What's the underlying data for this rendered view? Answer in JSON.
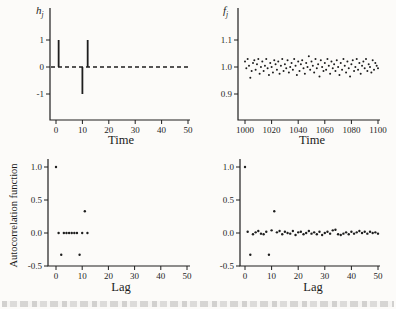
{
  "figure": {
    "background": "#fcfbf9",
    "ink": "#1e1e1e"
  },
  "chart_data": [
    {
      "id": "impulse-response",
      "type": "stem",
      "ylabel_parts": {
        "base": "h",
        "sub": "j"
      },
      "xlabel": "Time",
      "xlim": [
        0,
        50
      ],
      "ylim": [
        -2,
        2.2
      ],
      "xticks": [
        "0",
        "10",
        "20",
        "30",
        "40",
        "50"
      ],
      "yticks": [
        "1",
        "0",
        "-1"
      ],
      "zero_line": "dashed",
      "grid": "off",
      "points": [
        {
          "x": 1,
          "y": 1
        },
        {
          "x": 10,
          "y": -1
        },
        {
          "x": 12,
          "y": 1
        }
      ]
    },
    {
      "id": "time-series",
      "type": "scatter",
      "ylabel_parts": {
        "base": "f",
        "sub": "j"
      },
      "xlabel": "Time",
      "xlim": [
        1000,
        1100
      ],
      "ylim": [
        0.8,
        1.22
      ],
      "xticks": [
        "1000",
        "1020",
        "1040",
        "1060",
        "1080",
        "1100"
      ],
      "yticks": [
        "1.1",
        "1.0",
        "0.9"
      ],
      "grid": "off",
      "x_start": 1000,
      "x_step": 1,
      "values": [
        1.02,
        0.995,
        1.03,
        1.005,
        0.96,
        0.985,
        1.015,
        1.025,
        0.99,
        1.01,
        1.03,
        0.975,
        1.0,
        1.02,
        0.985,
        1.005,
        1.03,
        0.995,
        0.97,
        1.015,
        1.0,
        0.98,
        1.025,
        1.01,
        0.99,
        1.02,
        0.975,
        1.005,
        1.03,
        0.985,
        1.01,
        0.995,
        1.025,
        0.98,
        1.0,
        1.015,
        0.99,
        1.03,
        1.005,
        0.97,
        1.02,
        0.985,
        1.01,
        1.025,
        0.995,
        0.975,
        1.015,
        1.0,
        1.04,
        0.99,
        1.02,
        1.005,
        0.98,
        1.03,
        0.995,
        1.01,
        0.965,
        1.025,
        1.0,
        0.985,
        1.015,
        0.99,
        1.03,
        1.005,
        0.975,
        1.02,
        0.995,
        1.01,
        0.985,
        1.025,
        1.0,
        0.97,
        1.015,
        0.99,
        1.03,
        1.005,
        0.98,
        1.02,
        0.995,
        0.965,
        1.01,
        1.025,
        0.985,
        1.0,
        1.03,
        0.99,
        1.015,
        0.975,
        1.005,
        1.02,
        0.995,
        1.03,
        0.985,
        1.01,
        1.0,
        0.98,
        1.025,
        0.99,
        1.015,
        1.005,
        0.995
      ]
    },
    {
      "id": "acf-of-filter",
      "type": "scatter",
      "ylabel": "Autocorrelation function",
      "xlabel": "Lag",
      "xlim": [
        0,
        50
      ],
      "ylim": [
        -0.5,
        1.12
      ],
      "xticks": [
        "0",
        "10",
        "20",
        "30",
        "40",
        "50"
      ],
      "yticks": [
        "1.0",
        "0.5",
        "0.0",
        "-0.5"
      ],
      "grid": "off",
      "x_start": 0,
      "x_step": 1,
      "values": [
        1.0,
        0.0,
        -0.33,
        0.0,
        0.0,
        0.0,
        0.0,
        0.0,
        0.0,
        -0.33,
        0.0,
        0.33,
        0.0
      ]
    },
    {
      "id": "acf-of-series",
      "type": "scatter",
      "ylabel": "",
      "xlabel": "Lag",
      "xlim": [
        0,
        50
      ],
      "ylim": [
        -0.5,
        1.12
      ],
      "xticks": [
        "0",
        "10",
        "20",
        "30",
        "40",
        "50"
      ],
      "yticks": [
        "1.0",
        "0.5",
        "0.0",
        "-0.5"
      ],
      "grid": "off",
      "x_start": 0,
      "x_step": 1,
      "values": [
        1.0,
        0.02,
        -0.33,
        -0.02,
        0.01,
        0.03,
        -0.01,
        -0.02,
        0.02,
        -0.33,
        0.04,
        0.33,
        0.01,
        0.03,
        -0.02,
        0.02,
        0.0,
        -0.01,
        0.03,
        -0.03,
        0.01,
        0.02,
        -0.02,
        0.0,
        0.03,
        -0.01,
        0.01,
        -0.02,
        0.02,
        -0.03,
        0.0,
        0.02,
        -0.01,
        0.04,
        0.05,
        -0.02,
        -0.03,
        -0.01,
        0.01,
        -0.02,
        0.02,
        -0.01,
        0.01,
        0.03,
        0.0,
        0.02,
        -0.01,
        0.02,
        0.0,
        0.01,
        -0.01
      ]
    }
  ]
}
